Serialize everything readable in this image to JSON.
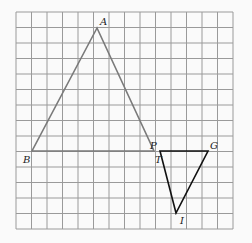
{
  "grid": {
    "x0": 16,
    "y0": 12,
    "cols": 14,
    "rows": 14,
    "cell": 15.5,
    "line_color": "#9a9a9a"
  },
  "triangles": [
    {
      "name": "ABT",
      "color": "#7a7a7a",
      "points": [
        [
          97,
          28
        ],
        [
          32,
          151
        ],
        [
          154,
          151
        ]
      ]
    },
    {
      "name": "PGI",
      "color": "#111111",
      "points": [
        [
          160,
          151
        ],
        [
          208,
          151
        ],
        [
          176,
          213
        ]
      ]
    }
  ],
  "labels": [
    {
      "text": "A",
      "x": 100,
      "y": 25
    },
    {
      "text": "B",
      "x": 23,
      "y": 163
    },
    {
      "text": "T",
      "x": 155,
      "y": 163
    },
    {
      "text": "P",
      "x": 150,
      "y": 149
    },
    {
      "text": "G",
      "x": 210,
      "y": 149
    },
    {
      "text": "I",
      "x": 180,
      "y": 224
    }
  ]
}
